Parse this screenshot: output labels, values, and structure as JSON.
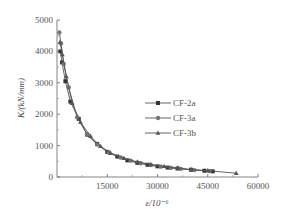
{
  "chart_data": {
    "type": "line",
    "title": "",
    "xlabel": "ε/10⁻⁶",
    "ylabel": "K/(kN/mm)",
    "xlim": [
      0,
      60000
    ],
    "ylim": [
      0,
      5000
    ],
    "xticks": [
      15000,
      30000,
      45000,
      60000
    ],
    "yticks": [
      0,
      1000,
      2000,
      3000,
      4000,
      5000
    ],
    "grid": false,
    "legend_position": "right-middle",
    "series": [
      {
        "name": "CF-2a",
        "marker": "square",
        "x": [
          1000,
          1500,
          2500,
          4000,
          6500,
          9000,
          12000,
          15000,
          18000,
          21000,
          24000,
          27000,
          30000,
          33000,
          36000,
          40000,
          44000,
          46500
        ],
        "y": [
          4000,
          3650,
          3050,
          2400,
          1850,
          1350,
          1050,
          800,
          650,
          530,
          450,
          390,
          340,
          300,
          270,
          230,
          200,
          180
        ]
      },
      {
        "name": "CF-3a",
        "marker": "circle",
        "x": [
          700,
          1200,
          2000,
          3500,
          6000,
          9000,
          12000,
          15500,
          19000,
          22000,
          25000,
          28000,
          31000,
          34000,
          37000,
          41000,
          45500
        ],
        "y": [
          4600,
          4250,
          3600,
          2850,
          1900,
          1350,
          1030,
          780,
          620,
          520,
          440,
          380,
          330,
          290,
          260,
          220,
          190
        ]
      },
      {
        "name": "CF-3b",
        "marker": "triangle",
        "x": [
          900,
          1600,
          2800,
          4500,
          7000,
          10000,
          13000,
          16000,
          20000,
          24000,
          28000,
          32000,
          36000,
          40000,
          45000,
          53500
        ],
        "y": [
          4300,
          3900,
          3200,
          2350,
          1750,
          1300,
          980,
          760,
          600,
          480,
          400,
          340,
          290,
          240,
          200,
          120
        ]
      }
    ]
  }
}
